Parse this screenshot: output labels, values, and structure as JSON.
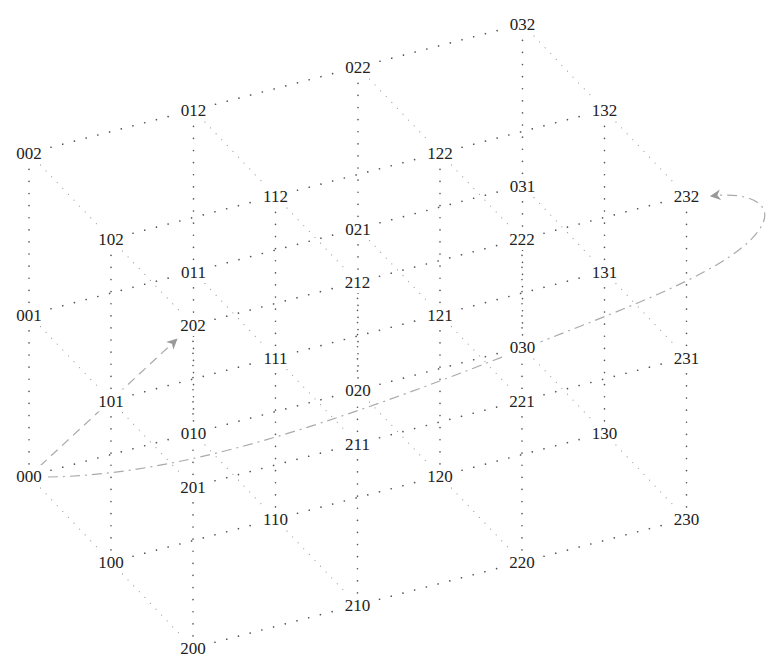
{
  "diagram": {
    "type": "lattice-3d",
    "dimensions": {
      "a": [
        0,
        1,
        2
      ],
      "b": [
        0,
        1,
        2,
        3
      ],
      "c": [
        0,
        1,
        2
      ]
    },
    "nodes": [
      "000",
      "001",
      "002",
      "010",
      "011",
      "012",
      "020",
      "021",
      "022",
      "030",
      "031",
      "032",
      "100",
      "101",
      "102",
      "110",
      "111",
      "112",
      "120",
      "121",
      "122",
      "130",
      "131",
      "132",
      "200",
      "201",
      "202",
      "210",
      "211",
      "212",
      "220",
      "221",
      "222",
      "230",
      "231",
      "232"
    ],
    "edge_rule": "nodes differing by 1 in exactly one coordinate are connected by dotted lines",
    "paths": [
      {
        "name": "dashed-path",
        "from": "000",
        "to": "202",
        "style": "dashed",
        "arrow": true
      },
      {
        "name": "dashdot-path",
        "from": "000",
        "to": "232",
        "style": "dash-dot",
        "arrow": true
      }
    ],
    "colors": {
      "label": "#222222",
      "edge": "#555555",
      "path": "#aaaaaa"
    }
  }
}
